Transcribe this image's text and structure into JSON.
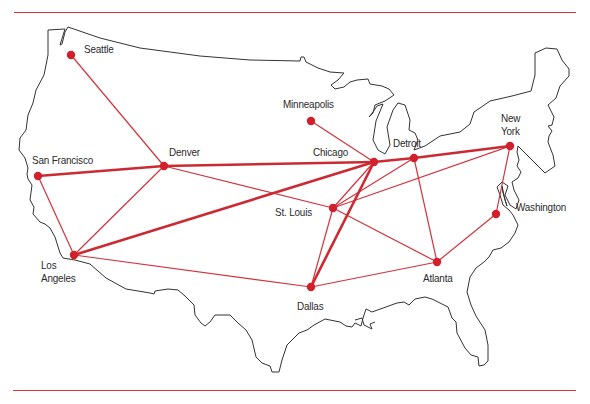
{
  "map": {
    "colors": {
      "route": "#d0343c",
      "dot": "#d11f2c",
      "outline": "#333333",
      "rule": "#d0343c"
    },
    "cities": [
      {
        "id": "seattle",
        "name": "Seattle",
        "x": 71,
        "y": 55,
        "lx": 84,
        "ly": 43
      },
      {
        "id": "san-francisco",
        "name": "San Francisco",
        "x": 38,
        "y": 176,
        "lx": 32,
        "ly": 154
      },
      {
        "id": "los-angeles",
        "name": "Los\nAngeles",
        "x": 74,
        "y": 255,
        "lx": 41,
        "ly": 259
      },
      {
        "id": "denver",
        "name": "Denver",
        "x": 164,
        "y": 166,
        "lx": 169,
        "ly": 146
      },
      {
        "id": "minneapolis",
        "name": "Minneapolis",
        "x": 311,
        "y": 121,
        "lx": 283,
        "ly": 98
      },
      {
        "id": "chicago",
        "name": "Chicago",
        "x": 374,
        "y": 162,
        "lx": 313,
        "ly": 146
      },
      {
        "id": "detroit",
        "name": "Detroit",
        "x": 414,
        "y": 158,
        "lx": 393,
        "ly": 137
      },
      {
        "id": "st-louis",
        "name": "St. Louis",
        "x": 333,
        "y": 208,
        "lx": 275,
        "ly": 206
      },
      {
        "id": "dallas",
        "name": "Dallas",
        "x": 311,
        "y": 287,
        "lx": 297,
        "ly": 300
      },
      {
        "id": "atlanta",
        "name": "Atlanta",
        "x": 437,
        "y": 262,
        "lx": 423,
        "ly": 272
      },
      {
        "id": "new-york",
        "name": "New\nYork",
        "x": 510,
        "y": 146,
        "lx": 501,
        "ly": 112
      },
      {
        "id": "washington",
        "name": "Washington",
        "x": 496,
        "y": 214,
        "lx": 516,
        "ly": 201
      }
    ],
    "routes": [
      {
        "from": "san-francisco",
        "to": "denver",
        "weight": "thick"
      },
      {
        "from": "denver",
        "to": "chicago",
        "weight": "thick"
      },
      {
        "from": "chicago",
        "to": "detroit",
        "weight": "thick"
      },
      {
        "from": "detroit",
        "to": "new-york",
        "weight": "thick"
      },
      {
        "from": "los-angeles",
        "to": "chicago",
        "weight": "thick"
      },
      {
        "from": "dallas",
        "to": "chicago",
        "weight": "thick"
      },
      {
        "from": "seattle",
        "to": "denver",
        "weight": "thin"
      },
      {
        "from": "san-francisco",
        "to": "los-angeles",
        "weight": "thin"
      },
      {
        "from": "los-angeles",
        "to": "denver",
        "weight": "thin"
      },
      {
        "from": "los-angeles",
        "to": "dallas",
        "weight": "thin"
      },
      {
        "from": "denver",
        "to": "st-louis",
        "weight": "thin"
      },
      {
        "from": "minneapolis",
        "to": "chicago",
        "weight": "thin"
      },
      {
        "from": "chicago",
        "to": "st-louis",
        "weight": "thin"
      },
      {
        "from": "st-louis",
        "to": "detroit",
        "weight": "thin"
      },
      {
        "from": "st-louis",
        "to": "new-york",
        "weight": "thin"
      },
      {
        "from": "st-louis",
        "to": "dallas",
        "weight": "thin"
      },
      {
        "from": "st-louis",
        "to": "atlanta",
        "weight": "thin"
      },
      {
        "from": "detroit",
        "to": "atlanta",
        "weight": "thin"
      },
      {
        "from": "dallas",
        "to": "atlanta",
        "weight": "thin"
      },
      {
        "from": "atlanta",
        "to": "washington",
        "weight": "thin"
      },
      {
        "from": "washington",
        "to": "new-york",
        "weight": "thin"
      }
    ]
  }
}
